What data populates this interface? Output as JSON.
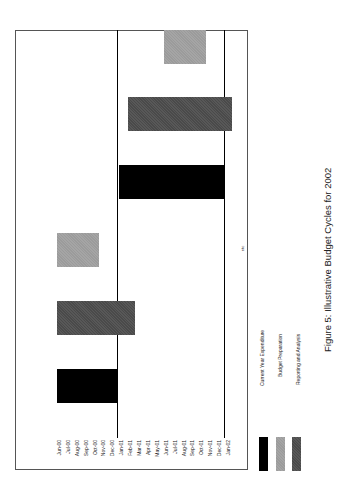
{
  "chart_data": {
    "type": "bar",
    "orientation": "gantt (figure rotated 90° counter-clockwise on page)",
    "title": "Figure 5:   Illustrative Budget Cycles for 2002",
    "xlabel": "",
    "ylabel": "",
    "categories": [
      "Jun-00",
      "Jul-00",
      "Aug-00",
      "Sep-00",
      "Oct-00",
      "Nov-00",
      "Dec-00",
      "Jan-01",
      "Feb-01",
      "Mar-01",
      "Apr-01",
      "May-01",
      "Jun-01",
      "Jul-01",
      "Aug-01",
      "Sep-01",
      "Oct-01",
      "Nov-01",
      "Dec-01",
      "Jan-02"
    ],
    "reference_lines": [
      "Dec-00",
      "Dec-01"
    ],
    "annotation": "etc",
    "series": [
      {
        "name": "Current Year Expenditure",
        "color": "#000000",
        "bars": [
          {
            "cycle": 1,
            "start": "Jun-00",
            "end": "Dec-00"
          },
          {
            "cycle": 2,
            "start": "Jan-01",
            "end": "Dec-01"
          }
        ]
      },
      {
        "name": "Reporting and Analysis",
        "color": "#4a4a4a",
        "bars": [
          {
            "cycle": 1,
            "start": "Jun-00",
            "end": "Feb-01"
          },
          {
            "cycle": 2,
            "start": "Feb-01",
            "end": "Jan-02"
          }
        ]
      },
      {
        "name": "Budget Preparation",
        "color": "#9b9b9b",
        "bars": [
          {
            "cycle": 1,
            "start": "Jun-00",
            "end": "Oct-00"
          },
          {
            "cycle": 2,
            "start": "Jun-01",
            "end": "Oct-01"
          }
        ]
      }
    ],
    "legend": [
      {
        "label": "Current Year Expenditure",
        "color": "#000000"
      },
      {
        "label": "Budget Preparation",
        "color": "#9b9b9b"
      },
      {
        "label": "Reporting and Analysis",
        "color": "#4a4a4a"
      }
    ],
    "legend_position": "bottom (rotated)",
    "grid": false
  },
  "caption": "Figure 5:   Illustrative Budget Cycles for 2002",
  "annotation": "etc",
  "legend_labels": [
    "Current Year Expenditure",
    "Budget Preparation",
    "Reporting and Analysis"
  ]
}
